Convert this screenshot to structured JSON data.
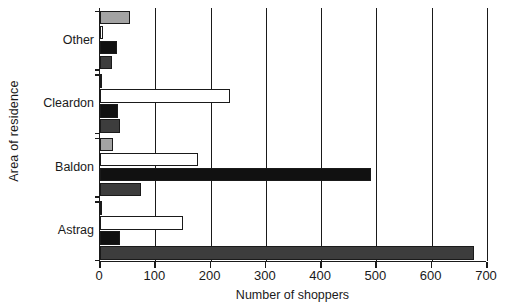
{
  "chart_data": {
    "type": "bar",
    "orientation": "horizontal",
    "title": "",
    "xlabel": "Number of shoppers",
    "ylabel": "Area of residence",
    "categories": [
      "Astrag",
      "Baldon",
      "Cleardon",
      "Other"
    ],
    "xlim": [
      0,
      700
    ],
    "xticks": [
      0,
      100,
      200,
      300,
      400,
      500,
      600,
      700
    ],
    "xtick_labels": [
      "0",
      "100",
      "200",
      "300",
      "400",
      "500",
      "600",
      "700"
    ],
    "grid": "vertical",
    "legend": "none",
    "series": [
      {
        "name": "series-1",
        "color": "#a3a3a3",
        "values": [
          0,
          23,
          0,
          55
        ]
      },
      {
        "name": "series-2",
        "color": "#ffffff",
        "values": [
          150,
          177,
          235,
          6
        ]
      },
      {
        "name": "series-3",
        "color": "#111111",
        "values": [
          37,
          490,
          32,
          30
        ]
      },
      {
        "name": "series-4",
        "color": "#3d3d3d",
        "values": [
          677,
          75,
          37,
          22
        ]
      }
    ]
  }
}
